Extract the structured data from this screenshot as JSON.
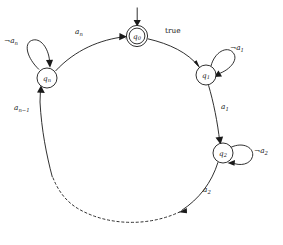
{
  "figure": {
    "type": "finite-state-automaton-diagram",
    "background_color": "#ffffff",
    "ink_color": "#1a1a1a",
    "width": 283,
    "height": 245
  },
  "states": [
    {
      "id": "q0",
      "label_base": "q",
      "label_sub": "0",
      "accepting": true,
      "initial": true,
      "cx": 137,
      "cy": 36,
      "r": 10.5
    },
    {
      "id": "q1",
      "label_base": "q",
      "label_sub": "1",
      "accepting": false,
      "initial": false,
      "cx": 206,
      "cy": 75,
      "r": 10
    },
    {
      "id": "q2",
      "label_base": "q",
      "label_sub": "2",
      "accepting": false,
      "initial": false,
      "cx": 223,
      "cy": 153,
      "r": 10
    },
    {
      "id": "qn",
      "label_base": "q",
      "label_sub": "n",
      "accepting": false,
      "initial": false,
      "cx": 47,
      "cy": 78,
      "r": 10
    }
  ],
  "transitions": [
    {
      "id": "initial-arrow",
      "from": "start",
      "to": "q0",
      "label": "",
      "style": "solid"
    },
    {
      "id": "q0-to-q1",
      "from": "q0",
      "to": "q1",
      "label_text": "true",
      "label_sub": "",
      "label_negated": false,
      "style": "solid"
    },
    {
      "id": "q1-to-q2",
      "from": "q1",
      "to": "q2",
      "label_text": "a",
      "label_sub": "1",
      "label_negated": false,
      "style": "solid"
    },
    {
      "id": "q2-to-dots",
      "from": "q2",
      "to": "...",
      "label_text": "a",
      "label_sub": "2",
      "label_negated": false,
      "style": "solid"
    },
    {
      "id": "dots-to-qn",
      "from": "...",
      "to": "qn",
      "label_text": "a",
      "label_sub": "n−1",
      "label_negated": false,
      "style": "dashed-then-solid"
    },
    {
      "id": "qn-to-q0",
      "from": "qn",
      "to": "q0",
      "label_text": "a",
      "label_sub": "n",
      "label_negated": false,
      "style": "solid"
    },
    {
      "id": "q1-self-loop",
      "from": "q1",
      "to": "q1",
      "label_text": "a",
      "label_sub": "1",
      "label_negated": true,
      "style": "solid"
    },
    {
      "id": "q2-self-loop",
      "from": "q2",
      "to": "q2",
      "label_text": "a",
      "label_sub": "2",
      "label_negated": true,
      "style": "solid"
    },
    {
      "id": "qn-self-loop",
      "from": "qn",
      "to": "qn",
      "label_text": "a",
      "label_sub": "n",
      "label_negated": true,
      "style": "solid"
    }
  ],
  "labels": {
    "q0_state": "q",
    "q0_sub": "0",
    "q1_state": "q",
    "q1_sub": "1",
    "q2_state": "q",
    "q2_sub": "2",
    "qn_state": "q",
    "qn_sub": "n",
    "true_label": "true",
    "a_n": "a",
    "a_n_sub": "n",
    "a_n_minus_1": "a",
    "a_n_minus_1_sub": "n−1",
    "a_1": "a",
    "a_1_sub": "1",
    "a_2": "a",
    "a_2_sub": "2",
    "not_a_n_sign": "¬",
    "not_a_n": "a",
    "not_a_n_sub": "n",
    "not_a_1_sign": "¬",
    "not_a_1": "a",
    "not_a_1_sub": "1",
    "not_a_2_sign": "¬",
    "not_a_2": "a",
    "not_a_2_sub": "2"
  }
}
